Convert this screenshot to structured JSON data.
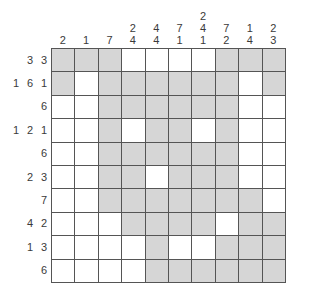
{
  "puzzle": {
    "type": "nonogram",
    "size": {
      "rows": 10,
      "cols": 10
    },
    "colors": {
      "filled": "#d6d6d6",
      "empty": "#ffffff",
      "grid_line": "#555555",
      "clue_text": "#3a3a3a",
      "background": "#ffffff"
    },
    "column_clues": [
      [
        "2"
      ],
      [
        "1"
      ],
      [
        "7"
      ],
      [
        "2",
        "4"
      ],
      [
        "4",
        "4"
      ],
      [
        "7",
        "1"
      ],
      [
        "2",
        "4",
        "1"
      ],
      [
        "7",
        "2"
      ],
      [
        "1",
        "4"
      ],
      [
        "2",
        "3"
      ]
    ],
    "row_clues": [
      [
        "3",
        "3"
      ],
      [
        "1",
        "6",
        "1"
      ],
      [
        "6"
      ],
      [
        "1",
        "2",
        "1"
      ],
      [
        "6"
      ],
      [
        "2",
        "3"
      ],
      [
        "7"
      ],
      [
        "4",
        "2"
      ],
      [
        "1",
        "3"
      ],
      [
        "6"
      ]
    ],
    "grid": [
      [
        1,
        1,
        1,
        0,
        0,
        0,
        0,
        1,
        1,
        1
      ],
      [
        1,
        0,
        1,
        1,
        1,
        1,
        1,
        1,
        0,
        1
      ],
      [
        0,
        0,
        1,
        1,
        1,
        1,
        1,
        1,
        0,
        0
      ],
      [
        0,
        0,
        1,
        0,
        1,
        1,
        0,
        1,
        0,
        0
      ],
      [
        0,
        0,
        1,
        1,
        1,
        1,
        1,
        1,
        0,
        0
      ],
      [
        0,
        0,
        1,
        1,
        0,
        1,
        1,
        1,
        0,
        0
      ],
      [
        0,
        0,
        1,
        1,
        1,
        1,
        1,
        1,
        1,
        0
      ],
      [
        0,
        0,
        0,
        1,
        1,
        1,
        1,
        0,
        1,
        1
      ],
      [
        0,
        0,
        0,
        0,
        1,
        0,
        0,
        1,
        1,
        1
      ],
      [
        0,
        0,
        0,
        0,
        1,
        1,
        1,
        1,
        1,
        1
      ]
    ]
  }
}
